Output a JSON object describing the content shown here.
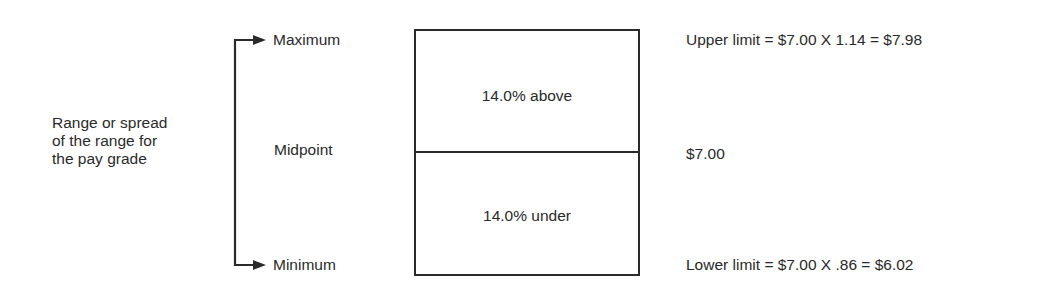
{
  "range_label": {
    "lines": [
      "Range or spread",
      "of the range for",
      "the pay grade"
    ]
  },
  "levels": {
    "maximum": "Maximum",
    "midpoint": "Midpoint",
    "minimum": "Minimum"
  },
  "box": {
    "upper_half": "14.0% above",
    "lower_half": "14.0% under"
  },
  "calculations": {
    "upper": "Upper limit = $7.00 X 1.14 = $7.98",
    "midpoint": "$7.00",
    "lower": "Lower limit = $7.00 X .86 = $6.02"
  },
  "colors": {
    "stroke": "#2a2a2a",
    "background": "#ffffff"
  }
}
